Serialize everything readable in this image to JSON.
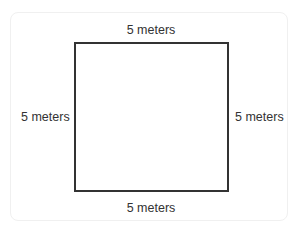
{
  "diagram": {
    "shape": "square",
    "labels": {
      "top": "5 meters",
      "bottom": "5 meters",
      "left": "5 meters",
      "right": "5 meters"
    },
    "colors": {
      "stroke": "#333333",
      "text": "#333333",
      "background": "#ffffff",
      "card_border": "#f0f0f0"
    }
  }
}
